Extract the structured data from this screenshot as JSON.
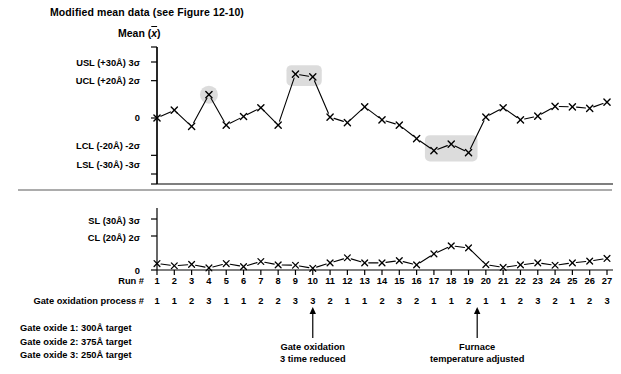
{
  "title": "Modified mean data (see Figure 12-10)",
  "mean_axis_title": "Mean (x̄)",
  "colors": {
    "ink": "#000000",
    "highlight": "#d6d6d6",
    "axis": "#000000"
  },
  "chart_data": [
    {
      "type": "line",
      "name": "mean-chart",
      "title": "Mean (x̄)",
      "xlabel": "Run #",
      "ylabel": "Mean (x̄)",
      "grid": false,
      "legend": "none",
      "ylim": [
        -3,
        3
      ],
      "ytick_values": [
        3,
        2,
        0,
        -2,
        -3
      ],
      "ytick_labels": [
        "USL (+30Å) 3σ",
        "UCL (+20Å) 2σ",
        "0",
        "LCL (-20Å) -2σ",
        "LSL (-30Å) -3σ"
      ],
      "x": [
        1,
        2,
        3,
        4,
        5,
        6,
        7,
        8,
        9,
        10,
        11,
        12,
        13,
        14,
        15,
        16,
        17,
        18,
        19,
        20,
        21,
        22,
        23,
        24,
        25,
        26,
        27
      ],
      "values": [
        0.0,
        0.42,
        -0.45,
        1.25,
        -0.38,
        0.08,
        0.55,
        -0.38,
        2.35,
        2.2,
        0.05,
        -0.25,
        0.6,
        -0.1,
        -0.38,
        -1.1,
        -1.75,
        -1.4,
        -1.85,
        0.05,
        0.55,
        -0.1,
        0.1,
        0.62,
        0.6,
        0.52,
        0.85
      ],
      "highlighted_points": [
        4,
        9,
        10,
        17,
        18,
        19
      ]
    },
    {
      "type": "line",
      "name": "range-chart",
      "xlabel": "Run #",
      "grid": false,
      "legend": "none",
      "ylim": [
        0,
        3
      ],
      "ytick_values": [
        3,
        2,
        0
      ],
      "ytick_labels": [
        "SL (30Å) 3σ",
        "CL (20Å) 2σ",
        "0"
      ],
      "x": [
        1,
        2,
        3,
        4,
        5,
        6,
        7,
        8,
        9,
        10,
        11,
        12,
        13,
        14,
        15,
        16,
        17,
        18,
        19,
        20,
        21,
        22,
        23,
        24,
        25,
        26,
        27
      ],
      "values": [
        0.38,
        0.25,
        0.33,
        0.12,
        0.38,
        0.2,
        0.5,
        0.3,
        0.28,
        0.1,
        0.42,
        0.72,
        0.42,
        0.42,
        0.55,
        0.3,
        0.95,
        1.42,
        1.3,
        0.32,
        0.15,
        0.3,
        0.42,
        0.28,
        0.42,
        0.52,
        0.68
      ]
    }
  ],
  "mean_chart": {
    "ytick_labels": [
      "USL (+30Å) 3σ",
      "UCL (+20Å) 2σ",
      "0",
      "LCL (-20Å) -2σ",
      "LSL (-30Å) -3σ"
    ]
  },
  "range_chart": {
    "ytick_labels": [
      "SL (30Å) 3σ",
      "CL (20Å) 2σ",
      "0"
    ]
  },
  "bottom": {
    "run_label": "Run #",
    "process_label": "Gate oxidation process #",
    "runs": [
      1,
      2,
      3,
      4,
      5,
      6,
      7,
      8,
      9,
      10,
      11,
      12,
      13,
      14,
      15,
      16,
      17,
      18,
      19,
      20,
      21,
      22,
      23,
      24,
      25,
      26,
      27
    ],
    "process": [
      1,
      1,
      2,
      3,
      1,
      1,
      2,
      2,
      3,
      3,
      2,
      1,
      1,
      2,
      3,
      2,
      1,
      1,
      2,
      1,
      1,
      2,
      3,
      2,
      1,
      2,
      3
    ]
  },
  "notes": [
    "Gate oxide 1: 300Å target",
    "Gate oxide 2: 375Å target",
    "Gate oxide 3: 250Å target"
  ],
  "annotations": [
    {
      "text_line1": "Gate oxidation",
      "text_line2": "3 time reduced",
      "run": 10
    },
    {
      "text_line1": "Furnace",
      "text_line2": "temperature adjusted",
      "run": 19.5
    }
  ]
}
